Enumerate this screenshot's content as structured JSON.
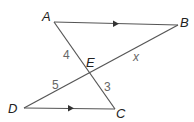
{
  "diagram": {
    "type": "geometry",
    "points": {
      "A": {
        "label": "A",
        "x": 54,
        "y": 22
      },
      "B": {
        "label": "B",
        "x": 178,
        "y": 25
      },
      "C": {
        "label": "C",
        "x": 115,
        "y": 109
      },
      "D": {
        "label": "D",
        "x": 24,
        "y": 108
      },
      "E": {
        "label": "E",
        "x": 89,
        "y": 72
      }
    },
    "segments": [
      {
        "from": "A",
        "to": "B",
        "parallel_mark": true
      },
      {
        "from": "D",
        "to": "C",
        "parallel_mark": true
      },
      {
        "from": "A",
        "to": "C"
      },
      {
        "from": "B",
        "to": "D"
      }
    ],
    "lengths": {
      "AE": "4",
      "EB": "x",
      "DE": "5",
      "EC": "3"
    },
    "colors": {
      "line": "#555555",
      "point_label": "#222222",
      "length_label": "#666666"
    }
  }
}
